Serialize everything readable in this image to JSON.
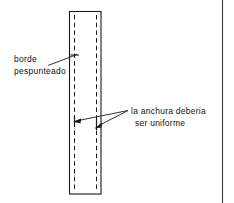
{
  "figure": {
    "name": "diagrama-pespunte",
    "background_color": "#ffffff",
    "ink_color": "#1a1a1a",
    "annotations": {
      "left": {
        "name": "borde-pespunteado",
        "line_1": "borde",
        "line_2": "pespunteado"
      },
      "right": {
        "name": "anchura-uniforme",
        "line_1": "la anchura deberia",
        "line_2": "ser uniforme"
      }
    },
    "shape": {
      "name": "tira-de-tela",
      "type": "rectangle",
      "stroke": "solid",
      "x": 69,
      "y": 11,
      "width": 32,
      "height": 183
    },
    "stitch_lines": [
      {
        "name": "pespunte-izquierdo",
        "x": 74.5,
        "y1": 15,
        "y2": 190,
        "style": "dashed"
      },
      {
        "name": "pespunte-derecho",
        "x": 96.5,
        "y1": 15,
        "y2": 190,
        "style": "dashed"
      }
    ],
    "leader_lines": [
      {
        "name": "leader-borde",
        "x1": 48,
        "y1": 65,
        "x2": 76,
        "y2": 55
      },
      {
        "name": "leader-anchura-izquierda",
        "x1": 128,
        "y1": 111,
        "x2": 75,
        "y2": 121
      },
      {
        "name": "leader-anchura-derecha",
        "x1": 128,
        "y1": 111,
        "x2": 96,
        "y2": 127
      }
    ],
    "tick_marks": [
      {
        "name": "tick-borde",
        "x": 74.5,
        "y": 55
      },
      {
        "name": "tick-anchura-izquierda",
        "x": 74.5,
        "y": 121
      },
      {
        "name": "tick-anchura-derecha",
        "x": 96.5,
        "y": 124
      }
    ],
    "margin_rule": {
      "name": "regla-margen-derecho",
      "x": 222,
      "y1": 0,
      "y2": 203
    }
  }
}
